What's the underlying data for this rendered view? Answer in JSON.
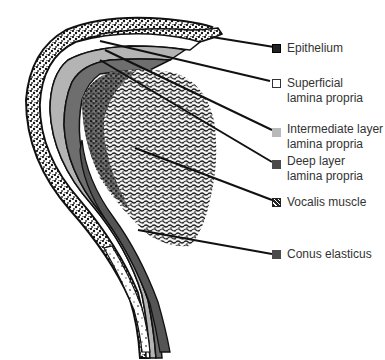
{
  "diagram": {
    "type": "anatomical-cross-section",
    "colors": {
      "epithelium": "#1a1a1a",
      "superficial_lamina_propria": "#ffffff",
      "intermediate_layer": "#b4b4b4",
      "deep_layer": "#6e6e6e",
      "vocalis_muscle": "#2a2a2a",
      "conus_elasticus": "#555555",
      "outline": "#111111"
    }
  },
  "legend": {
    "items": [
      {
        "id": "epithelium",
        "line1": "Epithelium",
        "line2": "",
        "swatch": "#222222",
        "pattern": "speckled"
      },
      {
        "id": "superficial",
        "line1": "Superficial",
        "line2": "lamina propria",
        "swatch": "#ffffff",
        "pattern": "outline"
      },
      {
        "id": "intermediate",
        "line1": "Intermediate layer",
        "line2": "lamina propria",
        "swatch": "#b9b9b9",
        "pattern": "solid"
      },
      {
        "id": "deep",
        "line1": "Deep layer",
        "line2": "lamina propria",
        "swatch": "#4a4a4a",
        "pattern": "solid"
      },
      {
        "id": "vocalis",
        "line1": "Vocalis muscle",
        "line2": "",
        "swatch": "#333333",
        "pattern": "speckled"
      },
      {
        "id": "conus",
        "line1": "Conus elasticus",
        "line2": "",
        "swatch": "#4a4a4a",
        "pattern": "solid"
      }
    ]
  }
}
